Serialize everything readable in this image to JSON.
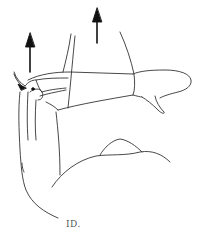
{
  "illustration": {
    "subject": "arm-traction-line-drawing",
    "stroke_color": "#333333",
    "arrow_color": "#111111",
    "background": "#ffffff",
    "arrows": [
      {
        "name": "left-upward-arrow",
        "x": 29,
        "y_top": 33,
        "y_bottom": 72
      },
      {
        "name": "center-upward-arrow",
        "x": 97,
        "y_top": 8,
        "y_bottom": 43
      }
    ],
    "signature": "ID."
  }
}
